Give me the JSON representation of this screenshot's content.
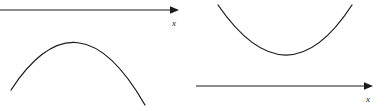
{
  "figure": {
    "background_color": "#ffffff",
    "stroke_color": "#1a1a1a",
    "width": 388,
    "height": 111
  },
  "panels": [
    {
      "id": "left",
      "caption": "Downward parabola entirely below the x-axis",
      "axis": {
        "label": "x",
        "orientation": "horizontal",
        "arrow_direction": "right",
        "y": 10,
        "x_start": 0,
        "x_end": 177,
        "label_x": 176,
        "label_y": 23
      },
      "curve": {
        "type": "parabola",
        "opens": "down",
        "vertex_x": 78,
        "vertex_y": 29,
        "left_end_x": 11,
        "left_end_y": 90,
        "right_end_x": 145,
        "right_end_y": 105
      }
    },
    {
      "id": "right",
      "caption": "Upward parabola entirely above the x-axis",
      "axis": {
        "label": "x",
        "orientation": "horizontal",
        "arrow_direction": "right",
        "y": 86,
        "x_start": 2,
        "x_end": 177,
        "label_x": 176,
        "label_y": 99
      },
      "curve": {
        "type": "parabola",
        "opens": "up",
        "vertex_x": 93,
        "vertex_y": 65,
        "left_end_x": 24,
        "left_end_y": 5,
        "right_end_x": 158,
        "right_end_y": 5
      }
    }
  ]
}
